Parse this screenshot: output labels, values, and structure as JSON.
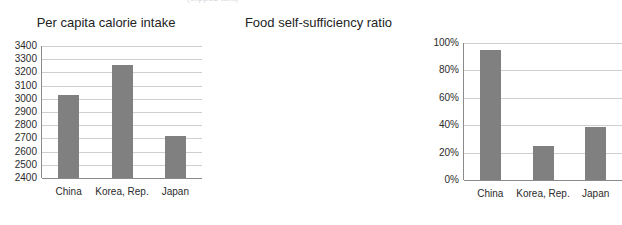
{
  "top_text_remnant": "(clipped text)",
  "colors": {
    "bar_fill": "#808080",
    "gridline": "#cfcfcf",
    "axis": "#8a8a8a",
    "background": "#ffffff",
    "text": "#2b2b2b"
  },
  "chart_data": [
    {
      "type": "bar",
      "title": "Per capita calorie intake",
      "xlabel": "",
      "ylabel": "",
      "categories": [
        "China",
        "Korea, Rep.",
        "Japan"
      ],
      "values": [
        3030,
        3255,
        2715
      ],
      "ylim": [
        2400,
        3400
      ],
      "ytick_labels": [
        "3400",
        "3300",
        "3200",
        "3100",
        "3000",
        "2900",
        "2800",
        "2700",
        "2600",
        "2500",
        "2400"
      ],
      "ytick_values": [
        3400,
        3300,
        3200,
        3100,
        3000,
        2900,
        2800,
        2700,
        2600,
        2500,
        2400
      ],
      "grid": true,
      "legend": "none",
      "series": [
        {
          "name": "Per capita calorie intake",
          "values": [
            3030,
            3255,
            2715
          ]
        }
      ]
    },
    {
      "type": "bar",
      "title": "Food self-sufficiency ratio",
      "xlabel": "",
      "ylabel": "",
      "categories": [
        "China",
        "Korea, Rep.",
        "Japan"
      ],
      "values": [
        95,
        25,
        39
      ],
      "ylim": [
        0,
        100
      ],
      "ytick_labels": [
        "100%",
        "80%",
        "60%",
        "40%",
        "20%",
        "0%"
      ],
      "ytick_values": [
        100,
        80,
        60,
        40,
        20,
        0
      ],
      "grid": true,
      "legend": "none",
      "series": [
        {
          "name": "Food self-sufficiency ratio",
          "values": [
            95,
            25,
            39
          ]
        }
      ]
    }
  ]
}
